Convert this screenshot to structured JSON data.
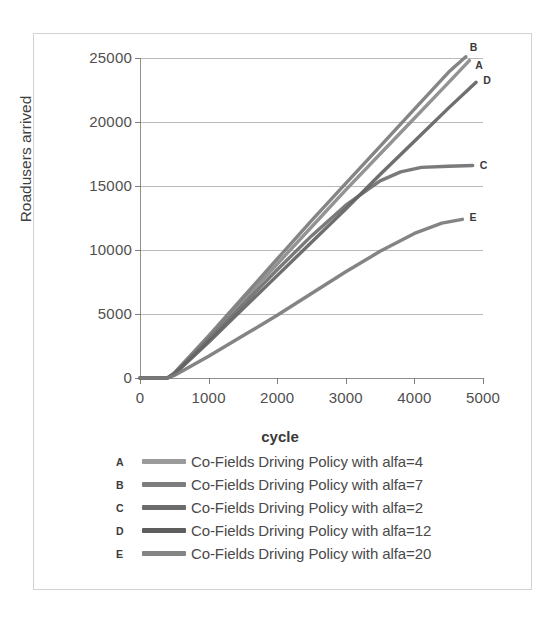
{
  "chart_data": {
    "type": "line",
    "title": "",
    "xlabel": "cycle",
    "ylabel": "Roadusers arrived",
    "xlim": [
      0,
      5000
    ],
    "ylim": [
      0,
      25000
    ],
    "xticks": [
      "0",
      "1000",
      "2000",
      "3000",
      "4000",
      "5000"
    ],
    "yticks": [
      "0",
      "5000",
      "10000",
      "15000",
      "20000",
      "25000"
    ],
    "grid": true,
    "legend_position": "below",
    "series": [
      {
        "key": "A",
        "name": "Co-Fields Driving Policy with alfa=4",
        "color": "#8a8a8a",
        "end_label": "A",
        "x": [
          0,
          400,
          500,
          1000,
          1500,
          2000,
          2500,
          3000,
          3500,
          4000,
          4500,
          4800
        ],
        "values": [
          0,
          0,
          350,
          3100,
          6000,
          8900,
          11800,
          14700,
          17500,
          20300,
          23100,
          24800
        ]
      },
      {
        "key": "B",
        "name": "Co-Fields Driving Policy with alfa=7",
        "color": "#7b7b7b",
        "end_label": "B",
        "x": [
          0,
          400,
          500,
          1000,
          1500,
          2000,
          2500,
          3000,
          3500,
          4000,
          4500,
          4750
        ],
        "values": [
          0,
          0,
          400,
          3300,
          6300,
          9300,
          12300,
          15200,
          18100,
          21000,
          23900,
          25100
        ]
      },
      {
        "key": "C",
        "name": "Co-Fields Driving Policy with alfa=2",
        "color": "#6f6f6f",
        "end_label": "C",
        "x": [
          0,
          400,
          500,
          1000,
          1500,
          2000,
          2500,
          3000,
          3500,
          3800,
          4100,
          4500,
          4850
        ],
        "values": [
          0,
          0,
          330,
          2950,
          5700,
          8450,
          11100,
          13500,
          15400,
          16100,
          16450,
          16550,
          16600
        ]
      },
      {
        "key": "D",
        "name": "Co-Fields Driving Policy with alfa=12",
        "color": "#636363",
        "end_label": "D",
        "x": [
          0,
          400,
          500,
          1000,
          1500,
          2000,
          2500,
          3000,
          3500,
          4000,
          4500,
          4900
        ],
        "values": [
          0,
          0,
          300,
          2800,
          5400,
          8000,
          10600,
          13200,
          15900,
          18500,
          21100,
          23100
        ]
      },
      {
        "key": "E",
        "name": "Co-Fields Driving Policy with alfa=20",
        "color": "#7a7a7a",
        "end_label": "E",
        "x": [
          0,
          400,
          500,
          1000,
          1500,
          2000,
          2500,
          3000,
          3500,
          4000,
          4400,
          4700
        ],
        "values": [
          0,
          0,
          200,
          1700,
          3300,
          4900,
          6600,
          8300,
          9900,
          11300,
          12100,
          12400
        ]
      }
    ]
  },
  "legend": {
    "rows": [
      {
        "key": "A",
        "label": "Co-Fields Driving Policy with alfa=4",
        "color": "#9a9a9a"
      },
      {
        "key": "B",
        "label": "Co-Fields Driving Policy with alfa=7",
        "color": "#7d7d7d"
      },
      {
        "key": "C",
        "label": "Co-Fields Driving Policy with alfa=2",
        "color": "#6b6b6b"
      },
      {
        "key": "D",
        "label": "Co-Fields Driving Policy with alfa=12",
        "color": "#5d5d5d"
      },
      {
        "key": "E",
        "label": "Co-Fields Driving Policy with alfa=20",
        "color": "#848484"
      }
    ]
  }
}
